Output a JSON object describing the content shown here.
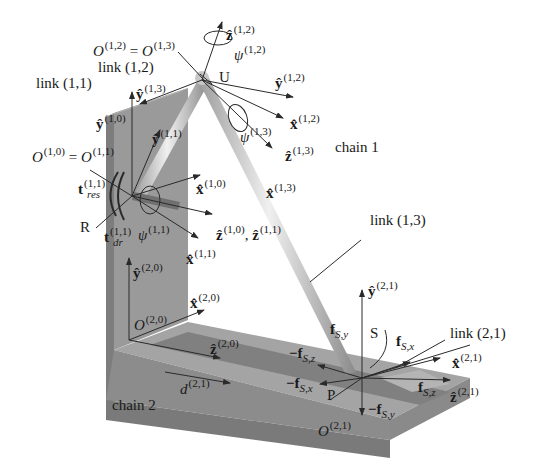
{
  "figure": {
    "type": "kinematic-mechanism-diagram",
    "colors": {
      "plate_face": "#9a9a9a",
      "plate_side": "#7d7d7d",
      "plate_top": "#a8a8a8",
      "slot": "#787878",
      "rod_light": "#e6e6e6",
      "rod_dark": "#9c9c9c",
      "line": "#2a2a2a",
      "text": "#1a1a1a",
      "background": "#ffffff"
    }
  },
  "labels": {
    "o12_eq_o13": {
      "base1": "O",
      "sup1": "(1,2)",
      "eq": " = ",
      "base2": "O",
      "sup2": "(1,3)"
    },
    "link12": "link (1,2)",
    "link11": "link (1,1)",
    "z12": {
      "base": "ẑ",
      "sup": "(1,2)"
    },
    "psi12": {
      "base": "ψ",
      "sup": "(1,2)"
    },
    "U": "U",
    "y12": {
      "base": "ŷ",
      "sup": "(1,2)"
    },
    "x12": {
      "base": "x̂",
      "sup": "(1,2)"
    },
    "y13": {
      "base": "ŷ",
      "sup": "(1,3)"
    },
    "psi13": {
      "base": "ψ",
      "sup": "(1,3)"
    },
    "z13": {
      "base": "ẑ",
      "sup": "(1,3)"
    },
    "chain1": "chain 1",
    "x13": {
      "base": "x̂",
      "sup": "(1,3)"
    },
    "y10": {
      "base": "ŷ",
      "sup": "(1,0)"
    },
    "y11": {
      "base": "ŷ",
      "sup": "(1,1)"
    },
    "o10_eq_o11": {
      "base1": "O",
      "sup1": "(1,0)",
      "eq": " = ",
      "base2": "O",
      "sup2": "(1,1)"
    },
    "t_res": {
      "base": "t",
      "sup": "(1,1)",
      "sub": "res"
    },
    "x10": {
      "base": "x̂",
      "sup": "(1,0)"
    },
    "R": "R",
    "t_dr": {
      "base": "t",
      "sup": "(1,1)",
      "sub": "dr"
    },
    "psi11": {
      "base": "ψ",
      "sup": "(1,1)"
    },
    "z10_z11": {
      "base1": "ẑ",
      "sup1": "(1,0)",
      "sep": ", ",
      "base2": "ẑ",
      "sup2": "(1,1)"
    },
    "x11": {
      "base": "x̂",
      "sup": "(1,1)"
    },
    "link13": "link (1,3)",
    "y20": {
      "base": "ŷ",
      "sup": "(2,0)"
    },
    "x20": {
      "base": "x̂",
      "sup": "(2,0)"
    },
    "y21": {
      "base": "ŷ",
      "sup": "(2,1)"
    },
    "o20": {
      "base": "O",
      "sup": "(2,0)"
    },
    "f_sy": {
      "base": "f",
      "sub": "S,y"
    },
    "S": "S",
    "link21": "link (2,1)",
    "f_sx": {
      "base": "f",
      "sub": "S,x"
    },
    "z20": {
      "base": "ẑ",
      "sup": "(2,0)"
    },
    "neg_f_sz": {
      "base": "−f",
      "sub": "S,z"
    },
    "x21": {
      "base": "x̂",
      "sup": "(2,1)"
    },
    "neg_f_sx": {
      "base": "−f",
      "sub": "S,x"
    },
    "f_sz": {
      "base": "f",
      "sub": "S,z"
    },
    "d21": {
      "base": "d",
      "sup": "(2,1)"
    },
    "P": "P",
    "z21": {
      "base": "ẑ",
      "sup": "(2,1)"
    },
    "neg_f_sy": {
      "base": "−f",
      "sub": "S,y"
    },
    "chain2": "chain 2",
    "o21": {
      "base": "O",
      "sup": "(2,1)"
    }
  }
}
